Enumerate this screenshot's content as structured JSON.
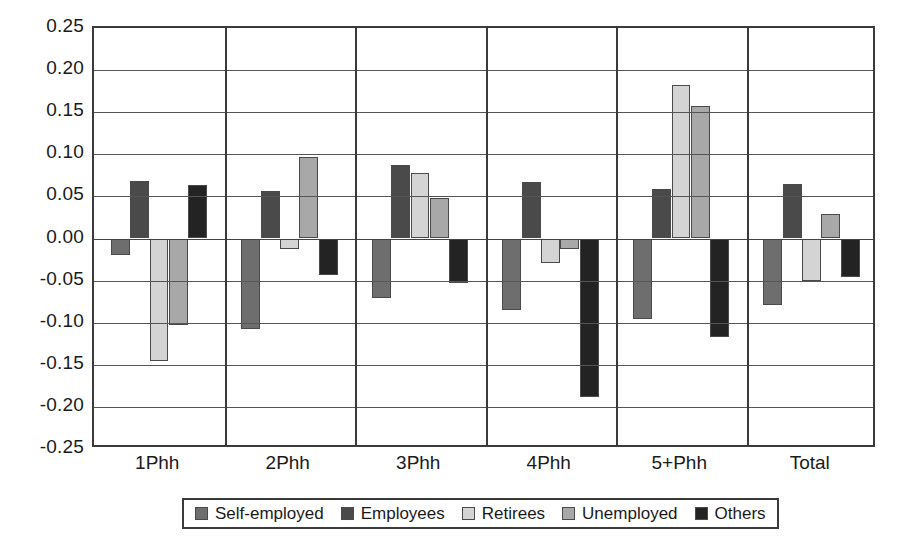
{
  "chart_data": {
    "type": "bar",
    "title": "",
    "subtitle": "",
    "xlabel": "",
    "ylabel": "",
    "grid": true,
    "legend_position": "bottom",
    "ylim": [
      -0.25,
      0.25
    ],
    "ytick_labels": [
      "0.25",
      "0.20",
      "0.15",
      "0.10",
      "0.05",
      "0.00",
      "-0.05",
      "-0.10",
      "-0.15",
      "-0.20",
      "-0.25"
    ],
    "ytick_values": [
      0.25,
      0.2,
      0.15,
      0.1,
      0.05,
      0.0,
      -0.05,
      -0.1,
      -0.15,
      -0.2,
      -0.25
    ],
    "categories": [
      "1Phh",
      "2Phh",
      "3Phh",
      "4Phh",
      "5+Phh",
      "Total"
    ],
    "series": [
      {
        "name": "Self-employed",
        "color": "#6e6e6e",
        "values": [
          -0.02,
          -0.107,
          -0.071,
          -0.085,
          -0.096,
          -0.079
        ]
      },
      {
        "name": "Employees",
        "color": "#4a4a4a",
        "values": [
          0.068,
          0.057,
          0.087,
          0.067,
          0.059,
          0.065
        ]
      },
      {
        "name": "Retirees",
        "color": "#d4d4d4",
        "values": [
          -0.146,
          -0.013,
          0.078,
          -0.029,
          0.182,
          -0.05
        ]
      },
      {
        "name": "Unemployed",
        "color": "#a8a8a8",
        "values": [
          -0.103,
          0.097,
          0.048,
          -0.012,
          0.157,
          0.029
        ]
      },
      {
        "name": "Others",
        "color": "#232323",
        "values": [
          0.064,
          -0.043,
          -0.053,
          -0.188,
          -0.117,
          -0.046
        ]
      }
    ]
  },
  "legend": {
    "items": [
      {
        "label": "Self-employed"
      },
      {
        "label": "Employees"
      },
      {
        "label": "Retirees"
      },
      {
        "label": "Unemployed"
      },
      {
        "label": "Others"
      }
    ]
  },
  "colors": {
    "axis": "#3a3a3a",
    "grid": "#555555",
    "text": "#1a1a1a",
    "background": "#ffffff"
  }
}
